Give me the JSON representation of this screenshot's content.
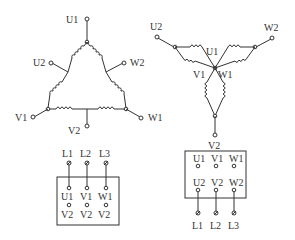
{
  "delta": {
    "title": "Delta connection",
    "labels": {
      "U1": "U1",
      "U2": "U2",
      "W2": "W2",
      "V1": "V1",
      "V2": "V2",
      "W1": "W1"
    },
    "terminal_box": {
      "lines": [
        "L1",
        "L2",
        "L3"
      ],
      "row1": [
        "U1",
        "V1",
        "W1"
      ],
      "row2": [
        "V2",
        "V2",
        "V2"
      ]
    }
  },
  "star": {
    "title": "Star connection",
    "labels": {
      "U2": "U2",
      "W2": "W2",
      "U1": "U1",
      "V1": "V1",
      "W1": "W1",
      "V2": "V2"
    },
    "terminal_box": {
      "row1": [
        "U1",
        "V1",
        "W1"
      ],
      "row2": [
        "U2",
        "V2",
        "W2"
      ],
      "lines": [
        "L1",
        "L2",
        "L3"
      ]
    }
  },
  "colors": {
    "stroke": "#333333",
    "background": "#ffffff"
  }
}
